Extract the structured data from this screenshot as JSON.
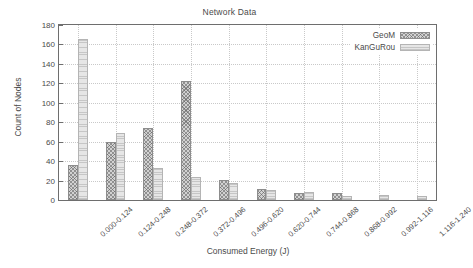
{
  "chart_data": {
    "type": "bar",
    "title": "Network Data",
    "xlabel": "Consumed Energy (J)",
    "ylabel": "Count of Nodes",
    "categories": [
      "0.000-0.124",
      "0.124-0.248",
      "0.248-0.372",
      "0.372-0.496",
      "0.496-0.620",
      "0.620-0.744",
      "0.744-0.868",
      "0.868-0.992",
      "0.992-1.116",
      "1.116-1.240"
    ],
    "series": [
      {
        "name": "GeoM",
        "color": "#d2d2d2",
        "pattern": "crosshatch",
        "values": [
          36,
          60,
          74,
          122,
          21,
          11,
          7,
          7,
          0,
          0
        ]
      },
      {
        "name": "KanGuRou",
        "color": "#e6e6e6",
        "pattern": "fine-horizontal-hatch",
        "values": [
          166,
          69,
          33,
          24,
          17,
          10,
          8,
          4,
          5,
          4
        ]
      }
    ],
    "ylim": [
      0,
      180
    ],
    "yticks": [
      0,
      20,
      40,
      60,
      80,
      100,
      120,
      140,
      160,
      180
    ],
    "ytick_labels": [
      "0",
      "20",
      "40",
      "60",
      "80",
      "100",
      "120",
      "140",
      "160",
      "180"
    ],
    "grid": true,
    "legend_position": "top-right",
    "xtick_label_rotation": -42
  },
  "legend": {
    "entries": [
      {
        "label": "GeoM"
      },
      {
        "label": "KanGuRou"
      }
    ]
  }
}
